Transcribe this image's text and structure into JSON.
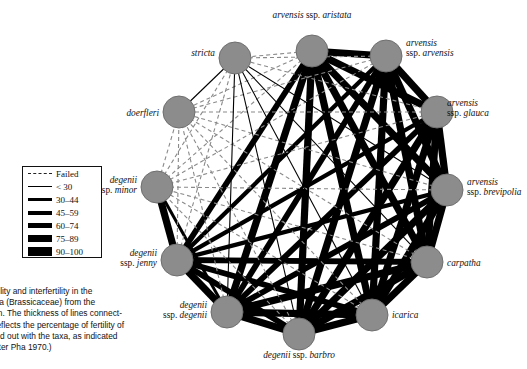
{
  "figure": {
    "node_fill": "#8c8c8c",
    "node_stroke": "#6f6f6f",
    "failed_edge_color": "#8a8a8a",
    "solid_edge_color": "#000000",
    "node_radius": 16
  },
  "nodes": [
    {
      "id": "aristata",
      "label_line1": "arvensis ssp. aristata",
      "label_line2": "",
      "x": 312,
      "y": 51,
      "lx": 312,
      "ly": 10,
      "align": "center"
    },
    {
      "id": "arvensis",
      "label_line1": "arvensis",
      "label_line2": "ssp. arvensis",
      "x": 386,
      "y": 56,
      "lx": 406,
      "ly": 38,
      "align": "left"
    },
    {
      "id": "glauca",
      "label_line1": "arvensis",
      "label_line2": "ssp. glauca",
      "x": 437,
      "y": 112,
      "lx": 447,
      "ly": 98,
      "align": "left"
    },
    {
      "id": "brevipolia",
      "label_line1": "arvensis",
      "label_line2": "ssp. brevipolia",
      "x": 447,
      "y": 190,
      "lx": 467,
      "ly": 177,
      "align": "left"
    },
    {
      "id": "carpatha",
      "label_line1": "carpatha",
      "label_line2": "",
      "x": 427,
      "y": 262,
      "lx": 447,
      "ly": 258,
      "align": "left"
    },
    {
      "id": "icarica",
      "label_line1": "icarica",
      "label_line2": "",
      "x": 372,
      "y": 315,
      "lx": 392,
      "ly": 310,
      "align": "left"
    },
    {
      "id": "barbro",
      "label_line1": "degenii ssp. barbro",
      "label_line2": "",
      "x": 299,
      "y": 334,
      "lx": 299,
      "ly": 350,
      "align": "center"
    },
    {
      "id": "degenii",
      "label_line1": "degenii",
      "label_line2": "ssp. degenii",
      "x": 227,
      "y": 312,
      "lx": 207,
      "ly": 300,
      "align": "right"
    },
    {
      "id": "jenny",
      "label_line1": "degenii",
      "label_line2": "ssp. jenny",
      "x": 177,
      "y": 260,
      "lx": 157,
      "ly": 248,
      "align": "right"
    },
    {
      "id": "minor",
      "label_line1": "degenii",
      "label_line2": "ssp. minor",
      "x": 157,
      "y": 187,
      "lx": 137,
      "ly": 175,
      "align": "right"
    },
    {
      "id": "doerfleri",
      "label_line1": "doerfleri",
      "label_line2": "",
      "x": 179,
      "y": 112,
      "lx": 159,
      "ly": 108,
      "align": "right"
    },
    {
      "id": "stricta",
      "label_line1": "stricta",
      "label_line2": "",
      "x": 235,
      "y": 58,
      "lx": 215,
      "ly": 48,
      "align": "right"
    }
  ],
  "legend": {
    "items": [
      {
        "label": "Failed",
        "style": "dashed",
        "width": 1
      },
      {
        "label": "< 30",
        "style": "solid",
        "width": 1
      },
      {
        "label": "30–44",
        "style": "solid",
        "width": 2.5
      },
      {
        "label": "45–59",
        "style": "solid",
        "width": 4
      },
      {
        "label": "60–74",
        "style": "solid",
        "width": 5.5
      },
      {
        "label": "75–89",
        "style": "solid",
        "width": 7
      },
      {
        "label": "90–100",
        "style": "solid",
        "width": 8.5
      }
    ]
  },
  "caption": {
    "lines": [
      "Figure 3  Fertility and interfertility in the",
      "genus Aubrieta (Brassicaceae) from the",
      "Aegean region. The thickness of lines connect-",
      "ing the taxa reflects the percentage of fertility of",
      "crosses carried out with the taxa, as indicated",
      "in the key. (After Pha 1970.)"
    ]
  },
  "edges": [
    {
      "a": "aristata",
      "b": "arvensis",
      "class": "w6"
    },
    {
      "a": "aristata",
      "b": "glauca",
      "class": "w6"
    },
    {
      "a": "aristata",
      "b": "brevipolia",
      "class": "w6"
    },
    {
      "a": "aristata",
      "b": "carpatha",
      "class": "w6"
    },
    {
      "a": "aristata",
      "b": "icarica",
      "class": "w6"
    },
    {
      "a": "aristata",
      "b": "barbro",
      "class": "w6"
    },
    {
      "a": "aristata",
      "b": "degenii",
      "class": "w6"
    },
    {
      "a": "aristata",
      "b": "jenny",
      "class": "w5"
    },
    {
      "a": "aristata",
      "b": "minor",
      "class": "failed"
    },
    {
      "a": "aristata",
      "b": "doerfleri",
      "class": "failed"
    },
    {
      "a": "aristata",
      "b": "stricta",
      "class": "failed"
    },
    {
      "a": "arvensis",
      "b": "glauca",
      "class": "w6"
    },
    {
      "a": "arvensis",
      "b": "brevipolia",
      "class": "w6"
    },
    {
      "a": "arvensis",
      "b": "carpatha",
      "class": "w6"
    },
    {
      "a": "arvensis",
      "b": "icarica",
      "class": "w6"
    },
    {
      "a": "arvensis",
      "b": "barbro",
      "class": "w6"
    },
    {
      "a": "arvensis",
      "b": "degenii",
      "class": "w5"
    },
    {
      "a": "arvensis",
      "b": "jenny",
      "class": "w4"
    },
    {
      "a": "arvensis",
      "b": "minor",
      "class": "failed"
    },
    {
      "a": "arvensis",
      "b": "doerfleri",
      "class": "failed"
    },
    {
      "a": "arvensis",
      "b": "stricta",
      "class": "failed"
    },
    {
      "a": "glauca",
      "b": "brevipolia",
      "class": "w6"
    },
    {
      "a": "glauca",
      "b": "carpatha",
      "class": "w6"
    },
    {
      "a": "glauca",
      "b": "icarica",
      "class": "w6"
    },
    {
      "a": "glauca",
      "b": "barbro",
      "class": "w6"
    },
    {
      "a": "glauca",
      "b": "degenii",
      "class": "w5"
    },
    {
      "a": "glauca",
      "b": "jenny",
      "class": "w4"
    },
    {
      "a": "glauca",
      "b": "minor",
      "class": "failed"
    },
    {
      "a": "glauca",
      "b": "doerfleri",
      "class": "failed"
    },
    {
      "a": "glauca",
      "b": "stricta",
      "class": "failed"
    },
    {
      "a": "brevipolia",
      "b": "carpatha",
      "class": "w6"
    },
    {
      "a": "brevipolia",
      "b": "icarica",
      "class": "w6"
    },
    {
      "a": "brevipolia",
      "b": "barbro",
      "class": "w6"
    },
    {
      "a": "brevipolia",
      "b": "degenii",
      "class": "w5"
    },
    {
      "a": "brevipolia",
      "b": "jenny",
      "class": "w4"
    },
    {
      "a": "brevipolia",
      "b": "minor",
      "class": "failed"
    },
    {
      "a": "brevipolia",
      "b": "doerfleri",
      "class": "failed"
    },
    {
      "a": "brevipolia",
      "b": "stricta",
      "class": "thin"
    },
    {
      "a": "carpatha",
      "b": "icarica",
      "class": "w6"
    },
    {
      "a": "carpatha",
      "b": "barbro",
      "class": "w6"
    },
    {
      "a": "carpatha",
      "b": "degenii",
      "class": "w6"
    },
    {
      "a": "carpatha",
      "b": "jenny",
      "class": "w5"
    },
    {
      "a": "carpatha",
      "b": "minor",
      "class": "failed"
    },
    {
      "a": "carpatha",
      "b": "doerfleri",
      "class": "failed"
    },
    {
      "a": "carpatha",
      "b": "stricta",
      "class": "thin"
    },
    {
      "a": "icarica",
      "b": "barbro",
      "class": "w6"
    },
    {
      "a": "icarica",
      "b": "degenii",
      "class": "w6"
    },
    {
      "a": "icarica",
      "b": "jenny",
      "class": "w5"
    },
    {
      "a": "icarica",
      "b": "minor",
      "class": "failed"
    },
    {
      "a": "icarica",
      "b": "doerfleri",
      "class": "failed"
    },
    {
      "a": "icarica",
      "b": "stricta",
      "class": "thin"
    },
    {
      "a": "barbro",
      "b": "degenii",
      "class": "w6"
    },
    {
      "a": "barbro",
      "b": "jenny",
      "class": "w5"
    },
    {
      "a": "barbro",
      "b": "minor",
      "class": "failed"
    },
    {
      "a": "barbro",
      "b": "doerfleri",
      "class": "failed"
    },
    {
      "a": "barbro",
      "b": "stricta",
      "class": "thin"
    },
    {
      "a": "degenii",
      "b": "jenny",
      "class": "w6"
    },
    {
      "a": "degenii",
      "b": "minor",
      "class": "w3"
    },
    {
      "a": "degenii",
      "b": "doerfleri",
      "class": "failed"
    },
    {
      "a": "degenii",
      "b": "stricta",
      "class": "thin"
    },
    {
      "a": "jenny",
      "b": "minor",
      "class": "w6"
    },
    {
      "a": "jenny",
      "b": "doerfleri",
      "class": "failed"
    },
    {
      "a": "jenny",
      "b": "stricta",
      "class": "failed"
    },
    {
      "a": "minor",
      "b": "doerfleri",
      "class": "failed"
    },
    {
      "a": "minor",
      "b": "stricta",
      "class": "failed"
    },
    {
      "a": "doerfleri",
      "b": "stricta",
      "class": "thin"
    }
  ]
}
